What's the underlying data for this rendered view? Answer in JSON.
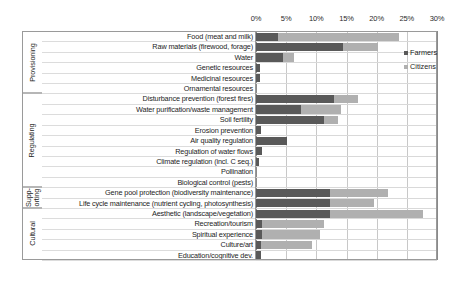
{
  "chart_data": {
    "type": "bar",
    "orientation": "horizontal",
    "stacked": false,
    "title": "",
    "xlabel": "",
    "ylabel": "",
    "xlim": [
      0,
      30
    ],
    "xunit": "%",
    "xticks": [
      "0%",
      "5%",
      "10%",
      "15%",
      "20%",
      "25%",
      "30%"
    ],
    "xtick_values": [
      0,
      5,
      10,
      15,
      20,
      25,
      30
    ],
    "grid": true,
    "legend_position": "right",
    "series": [
      {
        "name": "Farmers",
        "color": "#595959",
        "values": [
          3.6,
          14.4,
          4.4,
          0.6,
          0.6,
          0.0,
          12.9,
          7.4,
          11.2,
          0.9,
          5.1,
          1.0,
          0.5,
          0.0,
          0.0,
          12.2,
          12.3,
          12.3,
          1.0,
          1.0,
          0.9,
          0.9
        ]
      },
      {
        "name": "Citizens",
        "color": "#b0b0b0",
        "values": [
          23.7,
          20.2,
          6.3,
          0.0,
          0.0,
          0.0,
          16.9,
          14.1,
          13.6,
          0.0,
          0.0,
          0.0,
          0.0,
          0.0,
          0.0,
          21.8,
          19.6,
          27.7,
          11.3,
          10.6,
          9.2,
          0.0
        ]
      }
    ],
    "categories": [
      "Food (meat and milk)",
      "Raw materials (firewood, forage)",
      "Water",
      "Genetic resources",
      "Medicinal resources",
      "Ornamental resources",
      "Disturbance prevention (forest fires)",
      "Water purification/waste management",
      "Soil fertility",
      "Erosion prevention",
      "Air quality regulation",
      "Regulation of water flows",
      "Climate regulation (incl. C seq.)",
      "Pollination",
      "Biological control (pests)",
      "Gene pool protection (biodiversity maintenance)",
      "Life cycle maintenance (nutrient cycling, photosynthesis)",
      "Aesthetic (landscape/vegetation)",
      "Recreation/tourism",
      "Spiritual experience",
      "Culture/art",
      "Education/cognitive dev."
    ],
    "groups": [
      {
        "label": "Provisioning",
        "start": 0,
        "count": 6,
        "twoline": false
      },
      {
        "label": "Regulating",
        "start": 6,
        "count": 9,
        "twoline": false
      },
      {
        "label": "Supp-\norting",
        "label_line1": "Supp-",
        "label_line2": "orting",
        "start": 15,
        "count": 2,
        "twoline": true
      },
      {
        "label": "Cultural",
        "start": 17,
        "count": 5,
        "twoline": false
      }
    ]
  },
  "legend": {
    "items": [
      {
        "label": "Farmers",
        "color": "#595959"
      },
      {
        "label": "Citizens",
        "color": "#b0b0b0"
      }
    ]
  }
}
